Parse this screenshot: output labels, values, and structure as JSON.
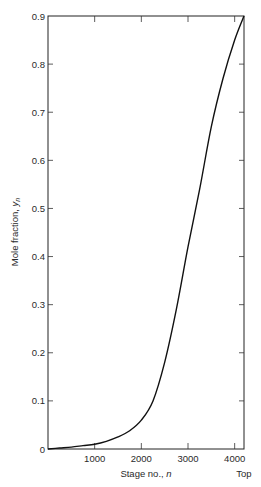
{
  "chart_data": {
    "type": "line",
    "title": "",
    "xlabel": "Stage no., n",
    "ylabel": "Mole fraction, y_n",
    "ylabel_main": "Mole fraction, ",
    "ylabel_var": "y",
    "ylabel_sub": "n",
    "xlabel_main": "Stage no., ",
    "xlabel_var": "n",
    "xlim": [
      0,
      4200
    ],
    "ylim": [
      0,
      0.9
    ],
    "x_ticks": [
      1000,
      2000,
      3000,
      4000
    ],
    "x_tick_labels": [
      "1000",
      "2000",
      "3000",
      "4000"
    ],
    "x_end_label": "Top",
    "y_ticks": [
      0,
      0.1,
      0.2,
      0.3,
      0.4,
      0.5,
      0.6,
      0.7,
      0.8,
      0.9
    ],
    "y_tick_labels": [
      "0",
      "0.1",
      "0.2",
      "0.3",
      "0.4",
      "0.5",
      "0.6",
      "0.7",
      "0.8",
      "0.9"
    ],
    "grid": false,
    "legend": null,
    "series": [
      {
        "name": "y_n",
        "x": [
          0,
          250,
          500,
          750,
          1000,
          1250,
          1500,
          1750,
          2000,
          2250,
          2500,
          2750,
          3000,
          3250,
          3500,
          3750,
          4000,
          4200
        ],
        "values": [
          0.0,
          0.002,
          0.004,
          0.007,
          0.01,
          0.016,
          0.025,
          0.038,
          0.06,
          0.1,
          0.18,
          0.29,
          0.42,
          0.54,
          0.67,
          0.77,
          0.85,
          0.9
        ]
      }
    ]
  }
}
